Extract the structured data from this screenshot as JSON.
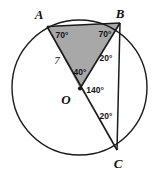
{
  "figure": {
    "type": "circle-geometry-diagram",
    "background_color": "#ffffff",
    "stroke_color": "#1a1a1a",
    "shade_color": "#a8a8a8",
    "circle": {
      "cx": 79.5,
      "cy": 87.5,
      "r": 67.5
    },
    "points": {
      "A": {
        "x": 47.0,
        "y": 26.5,
        "label": "A",
        "label_x": 39,
        "label_y": 19
      },
      "B": {
        "x": 120.0,
        "y": 23.0,
        "label": "B",
        "label_x": 120,
        "label_y": 18
      },
      "C": {
        "x": 117.0,
        "y": 150.0,
        "label": "C",
        "label_x": 118,
        "label_y": 167
      },
      "O": {
        "x": 80.0,
        "y": 88.5,
        "label": "O",
        "label_x": 66,
        "label_y": 103
      }
    },
    "segments": [
      {
        "name": "chord-AB",
        "from": "A",
        "to": "B"
      },
      {
        "name": "radius-OA",
        "from": "O",
        "to": "A"
      },
      {
        "name": "radius-OB",
        "from": "O",
        "to": "B"
      },
      {
        "name": "diameter-AOC",
        "from": "A",
        "to": "C"
      },
      {
        "name": "chord-BC",
        "from": "B",
        "to": "C"
      }
    ],
    "shaded_region": {
      "name": "triangle-AOB",
      "vertices": [
        "A",
        "B",
        "O"
      ]
    },
    "angle_labels": [
      {
        "name": "angle-at-A",
        "text": "70°",
        "x": 62,
        "y": 36
      },
      {
        "name": "angle-at-B",
        "text": "70°",
        "x": 104,
        "y": 35
      },
      {
        "name": "angle-OBC",
        "text": "20°",
        "x": 104,
        "y": 59
      },
      {
        "name": "angle-AOB",
        "text": "40°",
        "x": 78,
        "y": 72
      },
      {
        "name": "angle-BOC",
        "text": "140°",
        "x": 90,
        "y": 91
      },
      {
        "name": "angle-at-C",
        "text": "20°",
        "x": 104,
        "y": 117
      }
    ],
    "length_labels": [
      {
        "name": "radius-length-7",
        "text": "7",
        "x": 57,
        "y": 63
      }
    ]
  }
}
